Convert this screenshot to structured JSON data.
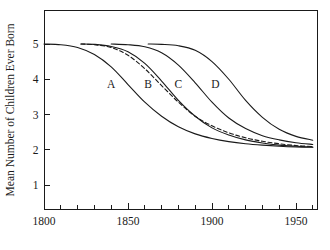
{
  "figure": {
    "title": "",
    "background_color": "#ffffff",
    "ink_color": "#1a1a1a"
  },
  "axes": {
    "y_axis_title": "Mean Number of Children Ever Born",
    "x_axis_title": ""
  },
  "labels": {
    "curve_a": "A",
    "curve_b": "B",
    "curve_c": "C",
    "curve_d": "D",
    "y_tick_1": "1",
    "y_tick_2": "2",
    "y_tick_3": "3",
    "y_tick_4": "4",
    "y_tick_5": "5",
    "x_tick_1800": "1800",
    "x_tick_1850": "1850",
    "x_tick_1900": "1900",
    "x_tick_1950": "1950"
  },
  "chart_data": {
    "type": "line",
    "title": "",
    "subtitle": "",
    "xlabel": "",
    "ylabel": "Mean Number of Children Ever Born",
    "xlim": [
      1800,
      1960
    ],
    "ylim": [
      0,
      5.7
    ],
    "grid": false,
    "legend": "inline-curve-labels",
    "x_major_ticks": [
      1800,
      1850,
      1900,
      1950
    ],
    "x_major_tick_labels": [
      "1800",
      "1850",
      "1900",
      "1950"
    ],
    "x_minor_ticks": [
      1810,
      1820,
      1830,
      1840,
      1860,
      1870,
      1880,
      1890,
      1910,
      1920,
      1930,
      1940,
      1960
    ],
    "x_tick_interval": 10,
    "y_ticks": [
      1,
      2,
      3,
      4,
      5
    ],
    "y_tick_labels": [
      "1",
      "2",
      "3",
      "4",
      "5"
    ],
    "annotations": [
      {
        "text": "A",
        "x": 1840,
        "y": 3.75
      },
      {
        "text": "B",
        "x": 1862,
        "y": 3.75
      },
      {
        "text": "C",
        "x": 1880,
        "y": 3.75
      },
      {
        "text": "D",
        "x": 1902,
        "y": 3.75
      }
    ],
    "series": [
      {
        "name": "A",
        "label": "A",
        "style": "solid",
        "color": "#1a1a1a",
        "x": [
          1800,
          1810,
          1820,
          1830,
          1840,
          1850,
          1860,
          1870,
          1880,
          1890,
          1900,
          1910,
          1920,
          1930,
          1940,
          1950,
          1960
        ],
        "values": [
          5.0,
          4.98,
          4.9,
          4.7,
          4.35,
          3.85,
          3.35,
          2.95,
          2.65,
          2.45,
          2.32,
          2.23,
          2.17,
          2.13,
          2.1,
          2.08,
          2.07
        ]
      },
      {
        "name": "B",
        "label": "B",
        "style": "solid",
        "color": "#1a1a1a",
        "x": [
          1822,
          1830,
          1840,
          1850,
          1860,
          1870,
          1880,
          1890,
          1900,
          1910,
          1920,
          1930,
          1940,
          1950,
          1960
        ],
        "values": [
          5.0,
          4.99,
          4.93,
          4.78,
          4.45,
          3.95,
          3.4,
          2.95,
          2.62,
          2.42,
          2.28,
          2.19,
          2.13,
          2.1,
          2.08
        ]
      },
      {
        "name": "C",
        "label": "C",
        "style": "dashed",
        "color": "#1a1a1a",
        "x": [
          1822,
          1830,
          1840,
          1850,
          1860,
          1870,
          1880,
          1890,
          1900,
          1910,
          1920,
          1930,
          1940,
          1950,
          1960
        ],
        "values": [
          5.0,
          4.98,
          4.9,
          4.68,
          4.3,
          3.82,
          3.35,
          2.95,
          2.68,
          2.48,
          2.34,
          2.24,
          2.17,
          2.12,
          2.09
        ]
      },
      {
        "name": "D",
        "label": "D",
        "style": "solid",
        "color": "#1a1a1a",
        "x": [
          1840,
          1850,
          1860,
          1870,
          1880,
          1890,
          1900,
          1910,
          1920,
          1930,
          1940,
          1950,
          1960
        ],
        "values": [
          5.0,
          4.98,
          4.92,
          4.75,
          4.4,
          3.9,
          3.35,
          2.9,
          2.6,
          2.4,
          2.28,
          2.2,
          2.15
        ]
      },
      {
        "name": "E",
        "label": "",
        "style": "solid",
        "color": "#1a1a1a",
        "x": [
          1862,
          1870,
          1880,
          1890,
          1900,
          1910,
          1920,
          1930,
          1940,
          1950,
          1960
        ],
        "values": [
          5.0,
          4.99,
          4.95,
          4.82,
          4.5,
          4.0,
          3.4,
          2.92,
          2.58,
          2.38,
          2.27
        ]
      }
    ]
  }
}
